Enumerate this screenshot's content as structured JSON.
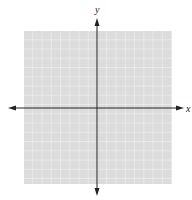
{
  "diagram": {
    "type": "coordinate-plane",
    "x_axis_label": "x",
    "y_axis_label": "y",
    "grid": {
      "left": 24,
      "top": 31,
      "right": 172,
      "bottom": 184,
      "cell_size": 9.25,
      "fill_color": "#dcdcdc",
      "line_color": "#f4f4f4"
    },
    "origin": {
      "x": 97,
      "y": 108
    },
    "axis_color": "#222222",
    "x_axis_extent": [
      8,
      184
    ],
    "y_axis_extent": [
      18,
      196
    ]
  }
}
